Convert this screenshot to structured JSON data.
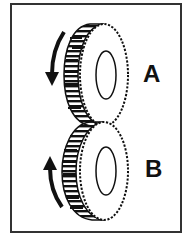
{
  "diagram": {
    "type": "gear-rotation",
    "gears": [
      {
        "id": "A",
        "label": "A",
        "rotation": "down (toward viewer side, left arrow points downward)"
      },
      {
        "id": "B",
        "label": "B",
        "rotation": "up (left arrow points upward)"
      }
    ],
    "colors": {
      "ink": "#111111",
      "frame": "#333333",
      "background": "#ffffff"
    }
  }
}
